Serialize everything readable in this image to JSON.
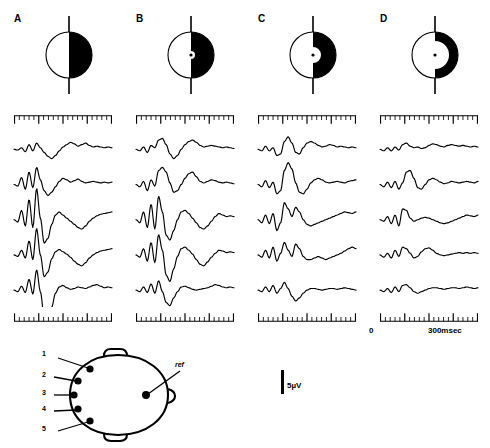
{
  "figure": {
    "type": "erp-waveform-figure",
    "panels": [
      {
        "letter": "A",
        "stimulus": {
          "name": "half-black-disk",
          "fill_fraction": 1.0,
          "has_fixation_dot": false,
          "inner_cut_fraction": 0.0
        }
      },
      {
        "letter": "B",
        "stimulus": {
          "name": "half-black-disk-with-fixation",
          "fill_fraction": 0.92,
          "has_fixation_dot": true,
          "inner_cut_fraction": 0.12
        }
      },
      {
        "letter": "C",
        "stimulus": {
          "name": "thick-crescent",
          "fill_fraction": 0.7,
          "has_fixation_dot": true,
          "inner_cut_fraction": 0.34
        }
      },
      {
        "letter": "D",
        "stimulus": {
          "name": "thin-crescent",
          "fill_fraction": 0.45,
          "has_fixation_dot": true,
          "inner_cut_fraction": 0.58
        }
      }
    ],
    "time_axis": {
      "start_label": "0",
      "end_label": "300msec",
      "start_ms": 0,
      "end_ms": 300,
      "major_tick_count": 4,
      "minor_ticks_per_major": 5
    },
    "amplitude_scale": {
      "label": "5µV",
      "value": 5,
      "unit": "µV"
    },
    "electrodes": {
      "labels": [
        "1",
        "2",
        "3",
        "4",
        "5"
      ],
      "reference_label": "ref",
      "count": 5
    }
  },
  "chart_data": {
    "type": "line",
    "title": "",
    "xlabel": "Time (msec)",
    "ylabel": "Amplitude (µV)",
    "xlim": [
      0,
      300
    ],
    "grid": false,
    "legend": "none",
    "panels": [
      {
        "label": "A",
        "series": [
          {
            "name": "electrode 1",
            "values": [
              0,
              -1,
              2,
              -3,
              6,
              -2,
              8,
              2,
              -4,
              -9,
              -12,
              -8,
              -2,
              3,
              6,
              9,
              7,
              4,
              6,
              8,
              5,
              3,
              4,
              3,
              2,
              3,
              2
            ]
          },
          {
            "name": "electrode 2",
            "values": [
              0,
              -2,
              9,
              -6,
              16,
              -4,
              22,
              6,
              -8,
              -14,
              -10,
              -3,
              4,
              8,
              6,
              3,
              5,
              7,
              4,
              2,
              3,
              4,
              3,
              2,
              3,
              2,
              3
            ]
          },
          {
            "name": "electrode 3",
            "values": [
              0,
              -3,
              12,
              -8,
              26,
              -10,
              40,
              2,
              -30,
              -24,
              -6,
              6,
              10,
              6,
              2,
              -2,
              -6,
              -10,
              -12,
              -8,
              -2,
              2,
              5,
              7,
              8,
              9,
              10
            ]
          },
          {
            "name": "electrode 4",
            "values": [
              0,
              -2,
              6,
              -4,
              18,
              -6,
              34,
              0,
              -28,
              -22,
              -5,
              4,
              7,
              4,
              1,
              -3,
              -8,
              -12,
              -14,
              -10,
              -4,
              0,
              3,
              5,
              6,
              7,
              8
            ]
          },
          {
            "name": "electrode 5",
            "values": [
              0,
              -2,
              5,
              -3,
              14,
              -5,
              26,
              -2,
              -34,
              -40,
              -22,
              -4,
              4,
              6,
              3,
              1,
              2,
              4,
              3,
              2,
              4,
              6,
              7,
              5,
              3,
              4,
              3
            ]
          }
        ]
      },
      {
        "label": "B",
        "series": [
          {
            "name": "electrode 1",
            "values": [
              0,
              -2,
              3,
              -4,
              5,
              2,
              12,
              14,
              6,
              -6,
              -12,
              -8,
              0,
              6,
              10,
              12,
              9,
              5,
              3,
              4,
              5,
              4,
              3,
              2,
              3,
              2,
              1
            ]
          },
          {
            "name": "electrode 2",
            "values": [
              0,
              -3,
              4,
              -8,
              6,
              -2,
              18,
              22,
              16,
              2,
              -10,
              -8,
              0,
              8,
              14,
              16,
              10,
              4,
              2,
              4,
              6,
              5,
              3,
              2,
              3,
              2,
              1
            ]
          },
          {
            "name": "electrode 3",
            "values": [
              0,
              -4,
              10,
              -10,
              20,
              -12,
              30,
              10,
              -20,
              -26,
              -14,
              0,
              10,
              12,
              8,
              2,
              -4,
              -10,
              -12,
              -8,
              -2,
              4,
              8,
              6,
              4,
              5,
              4
            ]
          },
          {
            "name": "electrode 4",
            "values": [
              0,
              -3,
              8,
              -8,
              16,
              -10,
              26,
              6,
              -26,
              -34,
              -18,
              -2,
              8,
              10,
              6,
              1,
              -6,
              -12,
              -14,
              -9,
              -3,
              2,
              6,
              5,
              3,
              4,
              3
            ]
          },
          {
            "name": "electrode 5",
            "values": [
              0,
              -2,
              4,
              -3,
              8,
              -4,
              12,
              -2,
              -16,
              -20,
              -10,
              -2,
              4,
              5,
              3,
              1,
              0,
              1,
              2,
              3,
              5,
              7,
              6,
              4,
              3,
              4,
              3
            ]
          }
        ]
      },
      {
        "label": "C",
        "series": [
          {
            "name": "electrode 1",
            "values": [
              0,
              -2,
              4,
              -2,
              2,
              -8,
              -6,
              10,
              16,
              8,
              -4,
              -6,
              2,
              8,
              10,
              8,
              5,
              3,
              4,
              6,
              5,
              3,
              4,
              3,
              2,
              3,
              2
            ]
          },
          {
            "name": "electrode 2",
            "values": [
              0,
              -3,
              5,
              -4,
              3,
              -12,
              -8,
              18,
              28,
              20,
              2,
              -10,
              -12,
              -6,
              2,
              6,
              8,
              6,
              3,
              2,
              3,
              4,
              3,
              2,
              4,
              5,
              6
            ]
          },
          {
            "name": "electrode 3",
            "values": [
              0,
              -4,
              6,
              -5,
              8,
              -14,
              -4,
              22,
              14,
              4,
              16,
              10,
              0,
              -6,
              -8,
              -6,
              -4,
              -2,
              0,
              2,
              4,
              6,
              8,
              10,
              9,
              8,
              10
            ]
          },
          {
            "name": "electrode 4",
            "values": [
              0,
              -3,
              6,
              -4,
              10,
              -8,
              2,
              16,
              6,
              -2,
              14,
              8,
              -2,
              -6,
              -6,
              -4,
              -2,
              -4,
              -6,
              -4,
              -2,
              0,
              2,
              5,
              8,
              10,
              8
            ]
          },
          {
            "name": "electrode 5",
            "values": [
              0,
              -2,
              4,
              -2,
              6,
              -4,
              2,
              10,
              2,
              -8,
              -14,
              -10,
              -4,
              0,
              2,
              2,
              1,
              0,
              1,
              2,
              2,
              1,
              2,
              3,
              2,
              1,
              0
            ]
          }
        ]
      },
      {
        "label": "D",
        "series": [
          {
            "name": "electrode 1",
            "values": [
              0,
              -2,
              2,
              -2,
              3,
              -1,
              6,
              8,
              4,
              2,
              3,
              1,
              2,
              5,
              7,
              6,
              4,
              3,
              5,
              6,
              5,
              4,
              5,
              4,
              3,
              4,
              3
            ]
          },
          {
            "name": "electrode 2",
            "values": [
              0,
              -3,
              3,
              -4,
              4,
              -6,
              2,
              16,
              18,
              8,
              -4,
              -6,
              0,
              6,
              8,
              6,
              3,
              1,
              2,
              4,
              3,
              2,
              3,
              4,
              3,
              2,
              4
            ]
          },
          {
            "name": "electrode 3",
            "values": [
              0,
              -2,
              4,
              -5,
              6,
              -8,
              14,
              12,
              2,
              -2,
              0,
              2,
              3,
              2,
              0,
              -2,
              -4,
              -5,
              -4,
              -2,
              0,
              2,
              4,
              6,
              5,
              4,
              6
            ]
          },
          {
            "name": "electrode 4",
            "values": [
              0,
              -3,
              2,
              -4,
              6,
              -2,
              10,
              8,
              2,
              -4,
              -2,
              4,
              8,
              9,
              6,
              2,
              0,
              -1,
              0,
              1,
              2,
              3,
              2,
              3,
              2,
              3,
              2
            ]
          },
          {
            "name": "electrode 5",
            "values": [
              0,
              -2,
              2,
              -3,
              4,
              -2,
              6,
              7,
              3,
              -2,
              -4,
              -2,
              0,
              2,
              3,
              3,
              2,
              1,
              2,
              3,
              3,
              2,
              3,
              4,
              3,
              2,
              3
            ]
          }
        ]
      }
    ]
  }
}
